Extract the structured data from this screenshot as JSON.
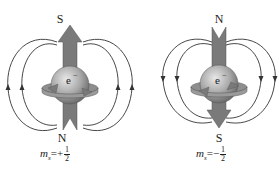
{
  "diagram": {
    "type": "electron-spin-magnetic-field",
    "panels": [
      {
        "id": "spin-up",
        "top_pole": "S",
        "bottom_pole": "N",
        "particle_label": "e⁻",
        "ms_symbol": "m",
        "ms_subscript": "s",
        "ms_sign": "=+",
        "ms_numerator": "1",
        "ms_denominator": "2",
        "arrow_direction": "up",
        "field_line_direction": "up"
      },
      {
        "id": "spin-down",
        "top_pole": "N",
        "bottom_pole": "S",
        "particle_label": "e⁻",
        "ms_symbol": "m",
        "ms_subscript": "s",
        "ms_sign": "=−",
        "ms_numerator": "1",
        "ms_denominator": "2",
        "arrow_direction": "down",
        "field_line_direction": "down"
      }
    ],
    "colors": {
      "arrow": "#7a7a7a",
      "sphere": "#a8a8a8",
      "sphere_highlight": "#e0e0e0",
      "field_lines": "#333333",
      "ring": "#9a9a9a",
      "background": "#ffffff"
    }
  }
}
